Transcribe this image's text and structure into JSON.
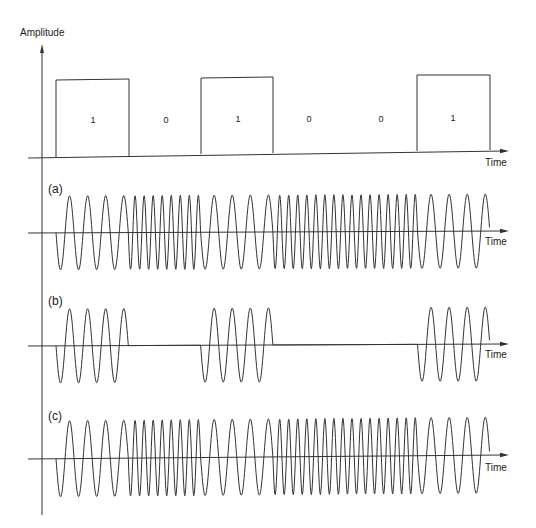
{
  "figure": {
    "y_axis_label": "Amplitude",
    "time_label": "Time",
    "bits": [
      "1",
      "0",
      "1",
      "0",
      "0",
      "1"
    ],
    "panels": [
      {
        "id": "a",
        "label": "(a)",
        "scheme": "FSK (continuous phase)"
      },
      {
        "id": "b",
        "label": "(b)",
        "scheme": "ASK (on-off keying)"
      },
      {
        "id": "c",
        "label": "(c)",
        "scheme": "FSK (discontinuous phase)"
      }
    ],
    "colors": {
      "line": "#333333",
      "background": "#ffffff"
    }
  },
  "chart_data": {
    "type": "line",
    "xlabel": "Time",
    "ylabel": "Amplitude",
    "bit_sequence": [
      1,
      0,
      1,
      0,
      0,
      1
    ],
    "bit_width_px": 72.3,
    "cycles_per_bit": {
      "bit_1": 4,
      "bit_0": 8
    },
    "series": [
      {
        "name": "Baseband data",
        "values": [
          1,
          0,
          1,
          0,
          0,
          1
        ]
      },
      {
        "name": "(a)",
        "description": "frequency shifts: 4 cycles per '1', 8 cycles per '0'"
      },
      {
        "name": "(b)",
        "description": "carrier (4 cycles) during '1', flat zero during '0'"
      },
      {
        "name": "(c)",
        "description": "frequency shifts with phase discontinuities at bit boundaries"
      }
    ]
  }
}
